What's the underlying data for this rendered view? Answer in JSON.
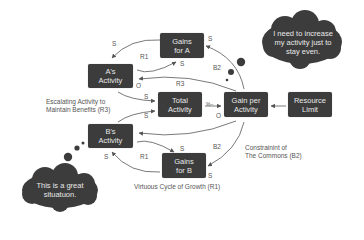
{
  "nodes": {
    "gains_a": {
      "line1": "Gains",
      "line2": "for A"
    },
    "a_activity": {
      "line1": "A's",
      "line2": "Activity"
    },
    "total_activity": {
      "line1": "Total",
      "line2": "Activity"
    },
    "gain_per_activity": {
      "line1": "Gain per",
      "line2": "Activity"
    },
    "resource_limit": {
      "line1": "Resource",
      "line2": "Limit"
    },
    "b_activity": {
      "line1": "B's",
      "line2": "Activity"
    },
    "gains_b": {
      "line1": "Gains",
      "line2": "for B"
    }
  },
  "polarity_labels": {
    "a_to_gains_a_s": "S",
    "gains_a_to_a_s": "S",
    "loop_r1_top": "R1",
    "a_o": "O",
    "loop_r3": "R3",
    "a_to_total_s": "S",
    "b_to_total_s": "S",
    "gpa_o": "O",
    "delay_mark": "%–",
    "gpa_to_gains_a_s": "S",
    "loop_b2_top": "B2",
    "b_s_top": "S",
    "loop_r1_bottom": "R1",
    "gains_b_to_b_s": "S",
    "loop_b2_bottom": "B2",
    "gpa_to_gains_b_s": "S"
  },
  "annotations": {
    "escalating_line1": "Escalating Activity to",
    "escalating_line2": "Maintain Benefits (R3)",
    "constraint_line1": "Constrainint of",
    "constraint_line2": "The Commons (B2)",
    "virtuous": "Virtuous Cycle of Growth (R1)"
  },
  "thought_bubbles": {
    "top": {
      "line1": "I need to increase",
      "line2": "my activity just to",
      "line3": "stay even."
    },
    "bottom": {
      "line1": "This is a great",
      "line2": "situatuon."
    }
  },
  "colors": {
    "node_fill": "#3c3c3c",
    "node_text": "#e8e8e8",
    "arrow": "#555555",
    "label": "#555555",
    "background": "#ffffff"
  }
}
